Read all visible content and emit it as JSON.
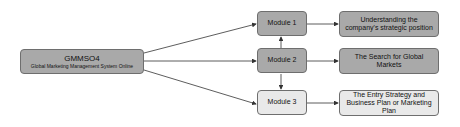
{
  "diagram": {
    "root": {
      "title": "GMMSO4",
      "subtitle": "Global Marketing Management System Online"
    },
    "modules": [
      {
        "label": "Module 1",
        "shade": "dark"
      },
      {
        "label": "Module 2",
        "shade": "dark"
      },
      {
        "label": "Module 3",
        "shade": "light"
      }
    ],
    "outcomes": [
      {
        "label": "Understanding the company's strategic position",
        "shade": "dark"
      },
      {
        "label": "The Search for Global Markets",
        "shade": "dark"
      },
      {
        "label": "The Entry Strategy and Business Plan or Marketing Plan",
        "shade": "light"
      }
    ],
    "edges": [
      {
        "from": "GMMSO4",
        "to": "Module 1"
      },
      {
        "from": "GMMSO4",
        "to": "Module 2"
      },
      {
        "from": "GMMSO4",
        "to": "Module 3"
      },
      {
        "from": "Module 2",
        "to": "Module 1"
      },
      {
        "from": "Module 2",
        "to": "Module 3"
      },
      {
        "from": "Module 1",
        "to": "Understanding the company's strategic position"
      },
      {
        "from": "Module 2",
        "to": "The Search for Global Markets"
      },
      {
        "from": "Module 3",
        "to": "The Entry Strategy and Business Plan or Marketing Plan"
      }
    ],
    "colors": {
      "dark": "#a9a9a9",
      "light": "#e9e9e9",
      "border": "#6e6e6e",
      "edge": "#333333"
    }
  }
}
